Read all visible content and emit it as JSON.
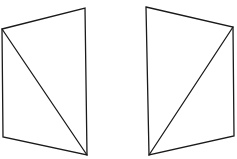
{
  "diagram": {
    "background": "#ffffff",
    "stroke_color": "#1a1a1a",
    "shapes": [
      {
        "name": "left-quadrilateral",
        "vertices": [
          [
            2,
            29
          ],
          [
            85,
            8
          ],
          [
            87,
            155
          ],
          [
            3,
            137
          ]
        ],
        "diagonal": [
          [
            2,
            29
          ],
          [
            87,
            155
          ]
        ]
      },
      {
        "name": "right-quadrilateral",
        "vertices": [
          [
            146,
            7
          ],
          [
            233,
            27
          ],
          [
            234,
            136
          ],
          [
            149,
            155
          ]
        ],
        "diagonal": [
          [
            233,
            27
          ],
          [
            149,
            155
          ]
        ]
      }
    ]
  }
}
